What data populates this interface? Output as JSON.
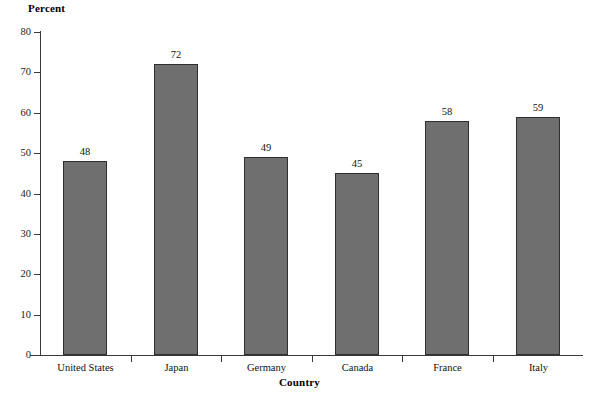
{
  "chart_data": {
    "type": "bar",
    "title": "",
    "subtitle": "",
    "categories": [
      "United States",
      "Japan",
      "Germany",
      "Canada",
      "France",
      "Italy"
    ],
    "values": [
      48,
      72,
      49,
      45,
      58,
      59
    ],
    "data_labels": [
      "48",
      "72",
      "49",
      "45",
      "58",
      "59"
    ],
    "xlabel": "Country",
    "ylabel": "Percent",
    "ylim": [
      0,
      80
    ],
    "yticks": [
      0,
      10,
      20,
      30,
      40,
      50,
      60,
      70,
      80
    ],
    "ytick_labels": [
      "0",
      "10",
      "20",
      "30",
      "40",
      "50",
      "60",
      "70",
      "80"
    ],
    "grid": false,
    "legend": false,
    "legend_position": "none",
    "bar_color": "#706f6f",
    "bar_edge_color": "#2e2e2e",
    "axis_color": "#3a3a3a",
    "background_color": "#ffffff"
  }
}
